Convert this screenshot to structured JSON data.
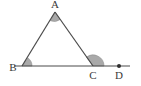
{
  "figure": {
    "background_color": "#ffffff",
    "stroke_color": "#4a4a4a",
    "angle_fill_color": "#a9a9a9",
    "label_color": "#3a3a3a",
    "labels": {
      "apex": "A",
      "left_base": "B",
      "right_base": "C",
      "extension_end": "D"
    },
    "points": {
      "A": {
        "x": 55,
        "y": 12
      },
      "B": {
        "x": 22,
        "y": 66
      },
      "C": {
        "x": 93,
        "y": 66
      },
      "D": {
        "x": 119,
        "y": 66
      },
      "line_start": {
        "x": 14,
        "y": 66
      },
      "line_end": {
        "x": 130,
        "y": 66
      }
    },
    "angles": [
      {
        "name": "angle-A",
        "vertex": "A",
        "radius": 9,
        "shaded": true
      },
      {
        "name": "angle-B",
        "vertex": "B",
        "radius": 10,
        "shaded": true
      },
      {
        "name": "angle-ACD-exterior",
        "vertex": "C",
        "radius": 11,
        "shaded": true
      }
    ],
    "markers": [
      {
        "name": "point-D-dot",
        "x": 119,
        "y": 66,
        "radius": 2
      }
    ]
  }
}
